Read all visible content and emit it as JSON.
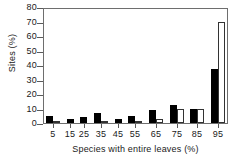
{
  "chart_data": {
    "type": "bar",
    "title": "",
    "xlabel": "Species with entire leaves (%)",
    "ylabel": "Sites (%)",
    "categories": [
      "5",
      "15",
      "25",
      "35",
      "45",
      "55",
      "65",
      "75",
      "85",
      "95"
    ],
    "xtick_labels": [
      "5",
      "15",
      "25",
      "35",
      "45",
      "55",
      "65",
      "75",
      "85",
      "95"
    ],
    "ytick_labels": [
      "0",
      "10",
      "20",
      "30",
      "40",
      "50",
      "60",
      "70",
      "80"
    ],
    "yticks": [
      0,
      10,
      20,
      30,
      40,
      50,
      60,
      70,
      80
    ],
    "ylim": [
      0,
      80
    ],
    "grid": false,
    "legend": "none",
    "series": [
      {
        "name": "solid",
        "fill": "#000000",
        "values": [
          5,
          3,
          4,
          7,
          3,
          5,
          9,
          12.5,
          10,
          37
        ]
      },
      {
        "name": "open",
        "fill": "#ffffff",
        "values": [
          1,
          0,
          0,
          1.5,
          0,
          1.5,
          3,
          10,
          10,
          70
        ]
      }
    ],
    "colors": {
      "solid_bar": "#000000",
      "open_bar_fill": "#ffffff",
      "open_bar_stroke": "#333333",
      "axis": "#6e6e6e",
      "text": "#1a1a1a",
      "background": "#ffffff"
    }
  }
}
